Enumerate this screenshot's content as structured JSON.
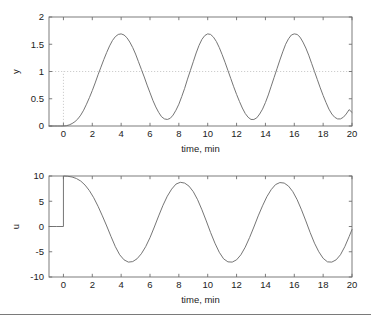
{
  "figure": {
    "background_color": "#ffffff",
    "line_color": "#6e6e6e",
    "axis_color": "#6e6e6e",
    "dotted_color": "#c8c8c8",
    "text_color": "#222222"
  },
  "chart_data": [
    {
      "type": "line",
      "id": "output-response",
      "title": "",
      "xlabel": "time, min",
      "ylabel": "y",
      "xlim": [
        -1,
        20
      ],
      "ylim": [
        0,
        2
      ],
      "xticks": [
        0,
        2,
        4,
        6,
        8,
        10,
        12,
        14,
        16,
        18,
        20
      ],
      "xticklabels": [
        "0",
        "2",
        "4",
        "6",
        "8",
        "10",
        "12",
        "14",
        "16",
        "18",
        "20"
      ],
      "yticks": [
        0,
        0.5,
        1,
        1.5,
        2
      ],
      "yticklabels": [
        "0",
        "0.5",
        "1",
        "1.5",
        "2"
      ],
      "grid": false,
      "legend": "none",
      "annotations": [
        {
          "name": "setpoint-line",
          "kind": "horizontal-dotted",
          "value": 1,
          "label": "setpoint y = 1"
        },
        {
          "name": "step-time-line",
          "kind": "vertical-dotted",
          "value": 0,
          "from": 0,
          "to": 1,
          "label": "step at t = 0"
        }
      ],
      "series": [
        {
          "name": "y",
          "x": [
            -1.0,
            -0.8,
            -0.6,
            -0.4,
            -0.2,
            0.0,
            0.2,
            0.4,
            0.6,
            0.8,
            1.0,
            1.2,
            1.4,
            1.6,
            1.8,
            2.0,
            2.2,
            2.4,
            2.6,
            2.8,
            3.0,
            3.2,
            3.4,
            3.6,
            3.8,
            4.0,
            4.2,
            4.4,
            4.6,
            4.8,
            5.0,
            5.2,
            5.4,
            5.6,
            5.8,
            6.0,
            6.2,
            6.4,
            6.6,
            6.8,
            7.0,
            7.2,
            7.4,
            7.6,
            7.8,
            8.0,
            8.2,
            8.4,
            8.6,
            8.8,
            9.0,
            9.2,
            9.4,
            9.6,
            9.8,
            10.0,
            10.2,
            10.4,
            10.6,
            10.8,
            11.0,
            11.2,
            11.4,
            11.6,
            11.8,
            12.0,
            12.2,
            12.4,
            12.6,
            12.8,
            13.0,
            13.2,
            13.4,
            13.6,
            13.8,
            14.0,
            14.2,
            14.4,
            14.6,
            14.8,
            15.0,
            15.2,
            15.4,
            15.6,
            15.8,
            16.0,
            16.2,
            16.4,
            16.6,
            16.8,
            17.0,
            17.2,
            17.4,
            17.6,
            17.8,
            18.0,
            18.2,
            18.4,
            18.6,
            18.8,
            19.0,
            19.2,
            19.4,
            19.6,
            19.8,
            20.0
          ],
          "y": [
            0.0,
            0.0,
            0.0,
            0.0,
            0.0,
            0.0,
            0.005,
            0.02,
            0.045,
            0.08,
            0.13,
            0.2,
            0.29,
            0.4,
            0.52,
            0.65,
            0.79,
            0.94,
            1.08,
            1.22,
            1.35,
            1.47,
            1.57,
            1.64,
            1.68,
            1.69,
            1.67,
            1.62,
            1.54,
            1.44,
            1.32,
            1.18,
            1.04,
            0.9,
            0.75,
            0.61,
            0.47,
            0.35,
            0.25,
            0.17,
            0.13,
            0.12,
            0.14,
            0.2,
            0.29,
            0.4,
            0.54,
            0.69,
            0.86,
            1.02,
            1.18,
            1.34,
            1.48,
            1.59,
            1.66,
            1.69,
            1.68,
            1.63,
            1.55,
            1.44,
            1.31,
            1.17,
            1.02,
            0.87,
            0.72,
            0.58,
            0.45,
            0.33,
            0.23,
            0.16,
            0.12,
            0.12,
            0.15,
            0.22,
            0.31,
            0.43,
            0.57,
            0.73,
            0.89,
            1.05,
            1.21,
            1.36,
            1.5,
            1.6,
            1.67,
            1.69,
            1.68,
            1.63,
            1.54,
            1.43,
            1.3,
            1.15,
            1.0,
            0.85,
            0.7,
            0.56,
            0.43,
            0.31,
            0.22,
            0.16,
            0.13,
            0.13,
            0.16,
            0.22,
            0.3,
            0.25
          ]
        }
      ]
    },
    {
      "type": "line",
      "id": "control-effort",
      "title": "",
      "xlabel": "time, min",
      "ylabel": "u",
      "xlim": [
        -1,
        20
      ],
      "ylim": [
        -10,
        10
      ],
      "xticks": [
        0,
        2,
        4,
        6,
        8,
        10,
        12,
        14,
        16,
        18,
        20
      ],
      "xticklabels": [
        "0",
        "2",
        "4",
        "6",
        "8",
        "10",
        "12",
        "14",
        "16",
        "18",
        "20"
      ],
      "yticks": [
        -10,
        -5,
        0,
        5,
        10
      ],
      "yticklabels": [
        "-10",
        "-5",
        "0",
        "5",
        "10"
      ],
      "grid": false,
      "legend": "none",
      "annotations": [
        {
          "name": "step-edge",
          "kind": "vertical-step",
          "value": 0,
          "from": 0,
          "to": 10,
          "label": "step from 0 to 10 at t = 0"
        }
      ],
      "series": [
        {
          "name": "u",
          "x": [
            -1.0,
            -0.5,
            0.0,
            0.0,
            0.3,
            0.6,
            0.9,
            1.2,
            1.5,
            1.8,
            2.1,
            2.4,
            2.7,
            3.0,
            3.3,
            3.6,
            3.9,
            4.2,
            4.5,
            4.8,
            5.1,
            5.4,
            5.7,
            6.0,
            6.3,
            6.6,
            6.9,
            7.2,
            7.5,
            7.8,
            8.1,
            8.4,
            8.7,
            9.0,
            9.3,
            9.6,
            9.9,
            10.2,
            10.5,
            10.8,
            11.1,
            11.4,
            11.7,
            12.0,
            12.3,
            12.6,
            12.9,
            13.2,
            13.5,
            13.8,
            14.1,
            14.4,
            14.7,
            15.0,
            15.3,
            15.6,
            15.9,
            16.2,
            16.5,
            16.8,
            17.1,
            17.4,
            17.7,
            18.0,
            18.3,
            18.6,
            18.9,
            19.2,
            19.5,
            19.8,
            20.0
          ],
          "y": [
            0.0,
            0.0,
            0.0,
            10.0,
            9.95,
            9.8,
            9.5,
            9.0,
            8.2,
            7.1,
            5.7,
            4.0,
            2.1,
            0.1,
            -2.0,
            -4.0,
            -5.6,
            -6.6,
            -7.05,
            -6.95,
            -6.4,
            -5.4,
            -4.0,
            -2.2,
            -0.1,
            2.1,
            4.2,
            6.0,
            7.4,
            8.4,
            8.75,
            8.6,
            8.0,
            6.9,
            5.3,
            3.3,
            1.1,
            -1.2,
            -3.3,
            -5.1,
            -6.4,
            -7.0,
            -7.05,
            -6.6,
            -5.6,
            -4.1,
            -2.2,
            -0.1,
            2.1,
            4.1,
            5.9,
            7.3,
            8.3,
            8.7,
            8.6,
            8.0,
            6.9,
            5.3,
            3.3,
            1.1,
            -1.2,
            -3.3,
            -5.0,
            -6.3,
            -7.0,
            -7.05,
            -6.6,
            -5.6,
            -4.0,
            -2.0,
            -0.6
          ]
        }
      ]
    }
  ]
}
